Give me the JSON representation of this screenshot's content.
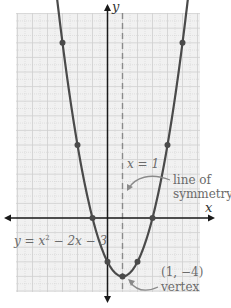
{
  "chart_data": {
    "type": "line",
    "title": "",
    "equation_label": "y = x² − 2x − 3",
    "xlabel": "x",
    "ylabel": "y",
    "xlim": [
      -6,
      6
    ],
    "ylim": [
      -5,
      13
    ],
    "grid": true,
    "function": "y = x^2 - 2x - 3",
    "plotted_points": [
      {
        "x": -3,
        "y": 12
      },
      {
        "x": -2,
        "y": 5
      },
      {
        "x": -1,
        "y": 0
      },
      {
        "x": 0,
        "y": -3
      },
      {
        "x": 1,
        "y": -4
      },
      {
        "x": 2,
        "y": -3
      },
      {
        "x": 3,
        "y": 0
      },
      {
        "x": 4,
        "y": 5
      },
      {
        "x": 5,
        "y": 12
      }
    ],
    "vertex": {
      "x": 1,
      "y": -4,
      "label": "(1, −4)",
      "annotation": "vertex"
    },
    "axis_of_symmetry": {
      "x": 1,
      "label": "x = 1",
      "annotation": "line of symmetry"
    },
    "colors": {
      "curve": "#4a4a4a",
      "axis": "#1a1a1a",
      "grid": "#cfcfcf",
      "grid_bg": "#f1f1f1",
      "dashed": "#8a8a8a",
      "label": "#6b6b6b"
    }
  },
  "labels": {
    "y_axis": "y",
    "x_axis": "x",
    "symmetry_eq": "x = 1",
    "symmetry_line1": "line of",
    "symmetry_line2": "symmetry",
    "equation_prefix": "y = x",
    "equation_exp": "2",
    "equation_suffix": " − 2x − 3",
    "vertex_coords": "(1, −4)",
    "vertex_word": "vertex"
  }
}
